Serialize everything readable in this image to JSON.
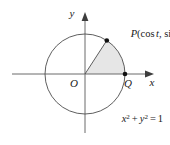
{
  "figure": {
    "axes": {
      "x_label": "x",
      "y_label": "y"
    },
    "labels": {
      "origin": "O",
      "point_q": "Q",
      "point_p_name": "P",
      "point_p_open_paren": "(",
      "point_p_cos": "cos",
      "point_p_t1": "t",
      "point_p_comma": ", ",
      "point_p_sin": "sin",
      "point_p_t2": "t",
      "point_p_close_paren": ")",
      "point_p_full": "P(cos t, sin t)"
    },
    "equation": {
      "x_var": "x",
      "x_exp": "2",
      "plus": "+",
      "y_var": "y",
      "y_exp": "2",
      "equals": "=",
      "value": "1",
      "full": "x² + y² = 1"
    },
    "colors": {
      "stroke": "#4d4d4d",
      "axis": "#6b6b6b",
      "sector_fill": "#e6e6e6",
      "text": "#1a1a1a",
      "point": "#111111",
      "background": "#ffffff"
    },
    "geometry": {
      "center_x": 85,
      "center_y": 74,
      "radius": 40,
      "angle_t_degrees": 57,
      "point_p_x": 106.8,
      "point_p_y": 40.5,
      "point_q_x": 125,
      "point_q_y": 74
    }
  }
}
